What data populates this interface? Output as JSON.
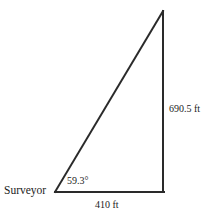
{
  "figure": {
    "type": "right-triangle-survey-diagram",
    "background_color": "#ffffff",
    "line_color": "#2a2a2a",
    "line_width_px": 2,
    "labels": {
      "vertex_left": "Surveyor",
      "angle": "59.3°",
      "vertical_side": "690.5 ft",
      "horizontal_side": "410 ft"
    },
    "geometry": {
      "apex": [
        163,
        11
      ],
      "bottom_right": [
        163,
        192
      ],
      "bottom_left": [
        55,
        192
      ]
    },
    "values": {
      "angle_degrees": 59.3,
      "opposite_side_ft": 690.5,
      "adjacent_side_ft": 410,
      "units": "ft"
    }
  }
}
